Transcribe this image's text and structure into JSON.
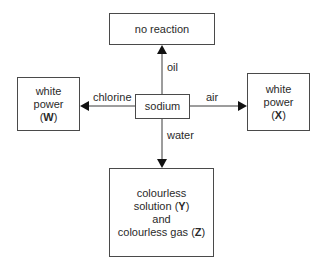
{
  "diagram": {
    "center": {
      "label": "sodium"
    },
    "top": {
      "reagent": "oil",
      "product_lines": [
        "no reaction"
      ]
    },
    "left": {
      "reagent": "chlorine",
      "product_lines": [
        "white",
        "power"
      ],
      "product_id": "W"
    },
    "right": {
      "reagent": "air",
      "product_lines": [
        "white",
        "power"
      ],
      "product_id": "X"
    },
    "bottom": {
      "reagent": "water",
      "product_lines": [
        "colourless",
        "solution",
        "and",
        "colourless gas"
      ],
      "product_ids": [
        "Y",
        "Z"
      ]
    }
  },
  "ui": {
    "paren_open": "(",
    "paren_close": ")"
  }
}
